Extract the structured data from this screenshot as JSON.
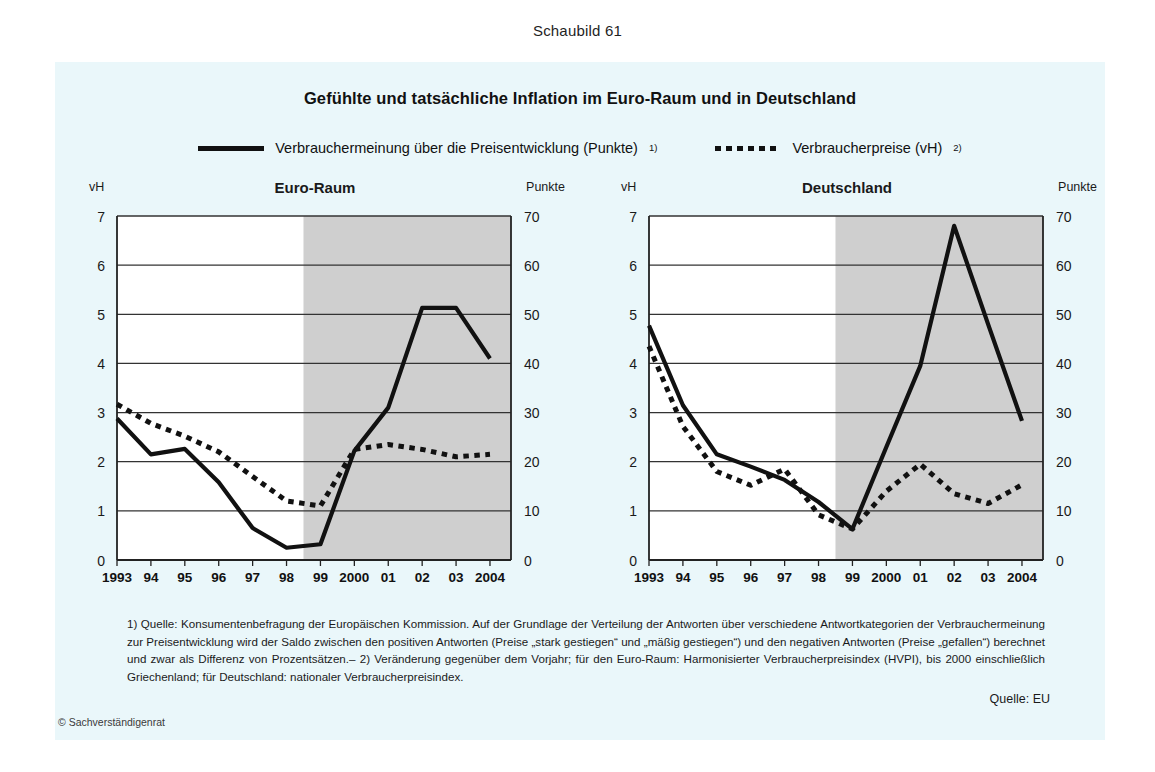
{
  "figure_number": "Schaubild 61",
  "title": "Gefühlte und tatsächliche Inflation im Euro-Raum und in Deutschland",
  "legend": [
    {
      "label": "Verbrauchermeinung über die Preisentwicklung (Punkte)",
      "note": "1)",
      "style": "solid"
    },
    {
      "label": "Verbraucherpreise (vH)",
      "note": "2)",
      "style": "dotted"
    }
  ],
  "axis_labels": {
    "left_unit": "vH",
    "right_unit": "Punkte"
  },
  "footnotes": {
    "text": "1) Quelle: Konsumentenbefragung der Europäischen Kommission. Auf der Grundlage der Verteilung der Antworten über verschiedene Antwortkategorien der Verbrauchermeinung zur Preisentwicklung wird der Saldo zwischen den positiven Antworten (Preise „stark gestiegen“ und „mäßig gestiegen“) und den negativen Antworten (Preise „gefallen“) berechnet und zwar als Differenz von Prozentsätzen.– 2) Veränderung gegenüber dem Vorjahr; für den Euro-Raum: Harmonisierter Verbraucherpreisindex (HVPI), bis 2000 einschließlich Griechenland; für Deutschland: nationaler Verbraucherpreisindex."
  },
  "source": "Quelle: EU",
  "copyright": "© Sachverständigenrat",
  "colors": {
    "panel_background": "#eaf7fa",
    "shaded_band": "#cfcfcf",
    "line": "#111111",
    "gridline": "#333333",
    "plot_background": "#ffffff"
  },
  "chart_data": [
    {
      "type": "line",
      "title": "Euro-Raum",
      "xlabel": "",
      "ylabel": "vH",
      "y2label": "Punkte",
      "grid": true,
      "legend_position": "top-center",
      "ylim": [
        0,
        7
      ],
      "y2lim": [
        0,
        70
      ],
      "yticks": [
        0,
        1,
        2,
        3,
        4,
        5,
        6,
        7
      ],
      "y2ticks": [
        0,
        10,
        20,
        30,
        40,
        50,
        60,
        70
      ],
      "x": [
        1993,
        1994,
        1995,
        1996,
        1997,
        1998,
        1999,
        2000,
        2001,
        2002,
        2003,
        2004
      ],
      "tick_labels": [
        "1993",
        "94",
        "95",
        "96",
        "97",
        "98",
        "99",
        "2000",
        "01",
        "02",
        "03",
        "2004"
      ],
      "shaded_from": 1998.5,
      "shaded_to": 2004.6,
      "series": [
        {
          "name": "Verbrauchermeinung über die Preisentwicklung (Punkte)",
          "style": "solid",
          "axis": "right",
          "unit": "Punkte",
          "values": [
            28.8,
            21.5,
            22.6,
            15.8,
            6.5,
            2.5,
            3.2,
            22.2,
            31.0,
            51.3,
            51.3,
            41.0
          ]
        },
        {
          "name": "Verbraucherpreise (vH)",
          "style": "dotted",
          "axis": "left",
          "unit": "vH",
          "values": [
            3.17,
            2.78,
            2.52,
            2.2,
            1.7,
            1.2,
            1.1,
            2.25,
            2.35,
            2.25,
            2.1,
            2.15
          ]
        }
      ]
    },
    {
      "type": "line",
      "title": "Deutschland",
      "xlabel": "",
      "ylabel": "vH",
      "y2label": "Punkte",
      "grid": true,
      "legend_position": "top-center",
      "ylim": [
        0,
        7
      ],
      "y2lim": [
        0,
        70
      ],
      "yticks": [
        0,
        1,
        2,
        3,
        4,
        5,
        6,
        7
      ],
      "y2ticks": [
        0,
        10,
        20,
        30,
        40,
        50,
        60,
        70
      ],
      "x": [
        1993,
        1994,
        1995,
        1996,
        1997,
        1998,
        1999,
        2000,
        2001,
        2002,
        2003,
        2004
      ],
      "tick_labels": [
        "1993",
        "94",
        "95",
        "96",
        "97",
        "98",
        "99",
        "2000",
        "01",
        "02",
        "03",
        "2004"
      ],
      "shaded_from": 1998.5,
      "shaded_to": 2004.6,
      "series": [
        {
          "name": "Verbrauchermeinung über die Preisentwicklung (Punkte)",
          "style": "solid",
          "axis": "right",
          "unit": "Punkte",
          "values": [
            47.7,
            31.5,
            21.5,
            19.0,
            16.3,
            11.8,
            6.3,
            23.0,
            39.5,
            68.0,
            48.0,
            28.3
          ]
        },
        {
          "name": "Verbraucherpreise (vH)",
          "style": "dotted",
          "axis": "left",
          "unit": "vH",
          "values": [
            4.35,
            2.72,
            1.8,
            1.52,
            1.85,
            0.92,
            0.63,
            1.4,
            1.95,
            1.35,
            1.15,
            1.53
          ]
        }
      ]
    }
  ]
}
